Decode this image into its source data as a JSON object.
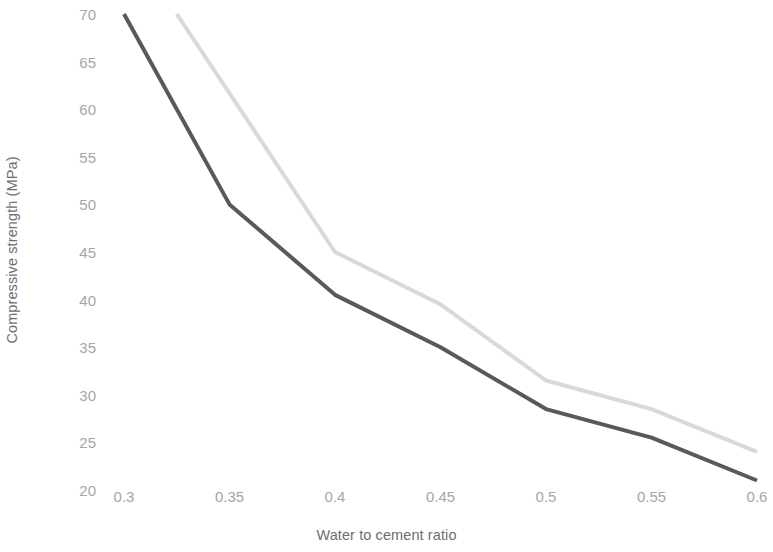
{
  "chart_data": {
    "type": "line",
    "title": "",
    "subtitle": "",
    "xlabel": "Water to cement ratio",
    "ylabel": "Compressive strength (MPa)",
    "xlim": [
      0.3,
      0.6
    ],
    "ylim": [
      20,
      70
    ],
    "xticks": [
      "0.3",
      "0.35",
      "0.4",
      "0.45",
      "0.5",
      "0.55",
      "0.6"
    ],
    "xtick_values": [
      0.3,
      0.35,
      0.4,
      0.45,
      0.5,
      0.55,
      0.6
    ],
    "yticks": [
      "70",
      "65",
      "60",
      "55",
      "50",
      "45",
      "40",
      "35",
      "30",
      "25",
      "20"
    ],
    "ytick_values": [
      70,
      65,
      60,
      55,
      50,
      45,
      40,
      35,
      30,
      25,
      20
    ],
    "grid": false,
    "legend": false,
    "legend_position": "none",
    "annotations": [],
    "series": [
      {
        "name": "series-1-dark",
        "color": "#595959",
        "line_width": 4,
        "x": [
          0.3,
          0.35,
          0.4,
          0.45,
          0.5,
          0.55,
          0.6
        ],
        "values": [
          70,
          50,
          40.5,
          35,
          28.5,
          25.5,
          21
        ]
      },
      {
        "name": "series-2-light",
        "color": "#d9d9d9",
        "line_width": 4,
        "x": [
          0.325,
          0.4,
          0.45,
          0.5,
          0.55,
          0.6
        ],
        "values": [
          70,
          45,
          39.5,
          31.5,
          28.5,
          24
        ]
      }
    ]
  }
}
